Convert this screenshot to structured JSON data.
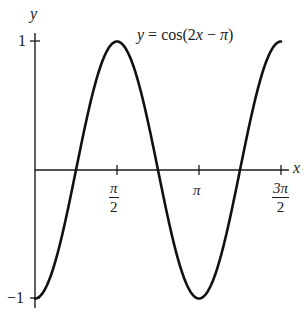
{
  "chart_data": {
    "type": "line",
    "title": "",
    "equation_label": "y = cos(2x − π)",
    "xlabel": "x",
    "ylabel": "y",
    "xlim": [
      0,
      4.712
    ],
    "ylim": [
      -1,
      1
    ],
    "grid": false,
    "legend": "none",
    "x_ticks": [
      {
        "value": 1.5708,
        "label_num": "π",
        "label_den": "2",
        "label": "π/2"
      },
      {
        "value": 3.1416,
        "label": "π"
      },
      {
        "value": 4.7124,
        "label_num": "3π",
        "label_den": "2",
        "label": "3π/2"
      }
    ],
    "y_ticks": [
      {
        "value": 1,
        "label": "1"
      },
      {
        "value": -1,
        "label": "−1"
      }
    ],
    "series": [
      {
        "name": "y = cos(2x − π)",
        "function": "cos(2x - pi)",
        "x": [
          0,
          0.3927,
          0.7854,
          1.1781,
          1.5708,
          1.9635,
          2.3562,
          2.7489,
          3.1416,
          3.5343,
          3.927,
          4.3197,
          4.7124
        ],
        "values": [
          -1,
          -0.707,
          0,
          0.707,
          1,
          0.707,
          0,
          -0.707,
          -1,
          -0.707,
          0,
          0.707,
          1
        ]
      }
    ],
    "key_points": {
      "maxima": [
        [
          1.5708,
          1
        ],
        [
          4.7124,
          1
        ]
      ],
      "minima": [
        [
          0,
          -1
        ],
        [
          3.1416,
          -1
        ]
      ],
      "zeros": [
        0.7854,
        2.3562,
        3.927
      ]
    }
  },
  "labels": {
    "y_axis": "y",
    "x_axis": "x",
    "y_tick_top": "1",
    "y_tick_bottom": "−1",
    "equation_lhs": "y",
    "equation_rhs": " = cos(2",
    "equation_x": "x",
    "equation_tail": " − ",
    "equation_pi": "π",
    "equation_close": ")",
    "tick_pi_half_num": "π",
    "tick_pi_half_den": "2",
    "tick_pi": "π",
    "tick_3pi_half_num": "3π",
    "tick_3pi_half_den": "2"
  }
}
